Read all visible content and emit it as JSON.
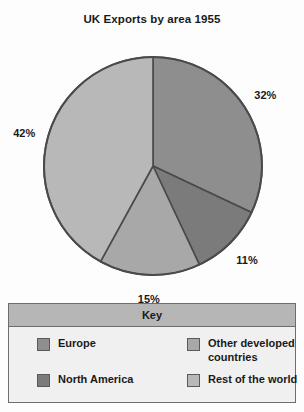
{
  "chart_data": {
    "type": "pie",
    "title": "UK Exports by area 1955",
    "unit": "%",
    "categories": [
      "Europe",
      "North America",
      "Other developed countries",
      "Rest of the world"
    ],
    "values": [
      32,
      11,
      15,
      42
    ],
    "labels": [
      "32%",
      "11%",
      "15%",
      "42%"
    ],
    "colors": [
      "#8e8e8e",
      "#7b7b7b",
      "#a8a8a8",
      "#b8b8b8"
    ],
    "start_angle_deg": 0,
    "direction": "clockwise",
    "legend_position": "bottom",
    "grid": false
  },
  "legend": {
    "header": "Key",
    "items": [
      {
        "label": "Europe",
        "color": "#8e8e8e"
      },
      {
        "label": "Other developed countries",
        "color": "#a8a8a8"
      },
      {
        "label": "North America",
        "color": "#7b7b7b"
      },
      {
        "label": "Rest of the world",
        "color": "#b8b8b8"
      }
    ]
  },
  "style": {
    "background": "#fdfdfd",
    "outline": "#4a4a4a",
    "text": "#1a1a1a",
    "legend_header_bg": "#b6b6b6",
    "legend_bg": "#f0f0f0"
  }
}
